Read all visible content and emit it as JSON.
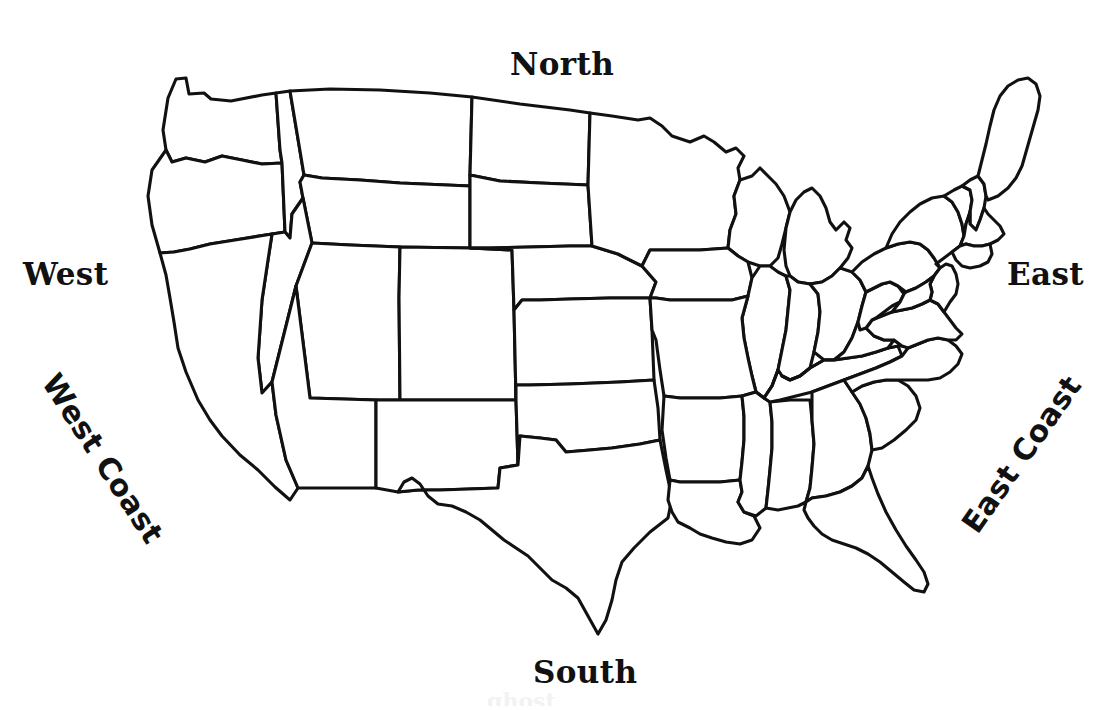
{
  "page": {
    "background_color": "#ffffff",
    "line_color": "#111111",
    "width": 1095,
    "height": 710
  },
  "map": {
    "name": "contiguous-united-states",
    "description": "Black outline map of the contiguous United States showing state boundaries, no fill, no state names",
    "stroke_color": "#111111",
    "fill_color": "#ffffff"
  },
  "labels": {
    "north": "North",
    "south": "South",
    "west": "West",
    "east": "East",
    "west_coast": "West Coast",
    "east_coast": "East Coast"
  },
  "watermark": {
    "text": "ghost"
  }
}
